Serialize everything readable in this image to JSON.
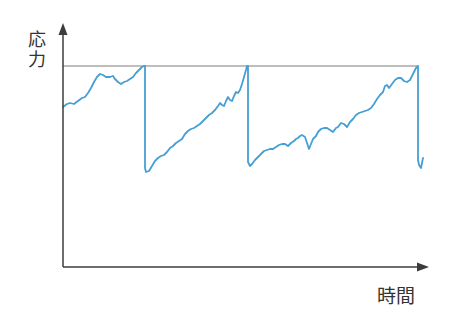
{
  "figure": {
    "ylabel": "応力",
    "xlabel": "時間",
    "colors": {
      "curve": "#459fd4",
      "axis": "#3c3c3c",
      "threshold": "#7f7f7f",
      "text": "#333333",
      "background": "#ffffff"
    }
  },
  "chart_data": {
    "type": "line",
    "title": "",
    "xlabel": "時間",
    "ylabel": "応力",
    "x_ticks": [],
    "y_ticks": [],
    "grid": false,
    "legend": false,
    "axes_px": {
      "y_axis_x": 63,
      "x_axis_y": 267,
      "y_arrow_tip_y": 23,
      "x_arrow_tip_x": 429
    },
    "threshold_line_px": {
      "y": 66,
      "x1": 63,
      "x2": 418
    },
    "series": [
      {
        "name": "応力",
        "color": "#459fd4",
        "points_px": [
          [
            63,
            107
          ],
          [
            67,
            104
          ],
          [
            70,
            103
          ],
          [
            74,
            104
          ],
          [
            78,
            101
          ],
          [
            82,
            98
          ],
          [
            85,
            97
          ],
          [
            88,
            93
          ],
          [
            91,
            88
          ],
          [
            94,
            82
          ],
          [
            97,
            77
          ],
          [
            100,
            74
          ],
          [
            103,
            75
          ],
          [
            106,
            77
          ],
          [
            110,
            77
          ],
          [
            113,
            76
          ],
          [
            115,
            79
          ],
          [
            118,
            82
          ],
          [
            121,
            84
          ],
          [
            124,
            82
          ],
          [
            127,
            81
          ],
          [
            130,
            79
          ],
          [
            133,
            77
          ],
          [
            136,
            73
          ],
          [
            139,
            70
          ],
          [
            142,
            67
          ],
          [
            144,
            66
          ],
          [
            145,
            66
          ],
          [
            145,
            168
          ],
          [
            146,
            172
          ],
          [
            149,
            171
          ],
          [
            152,
            166
          ],
          [
            155,
            161
          ],
          [
            158,
            158
          ],
          [
            161,
            156
          ],
          [
            164,
            155
          ],
          [
            167,
            152
          ],
          [
            170,
            148
          ],
          [
            173,
            146
          ],
          [
            176,
            143
          ],
          [
            179,
            141
          ],
          [
            182,
            139
          ],
          [
            185,
            134
          ],
          [
            188,
            131
          ],
          [
            191,
            129
          ],
          [
            194,
            128
          ],
          [
            197,
            126
          ],
          [
            200,
            124
          ],
          [
            203,
            121
          ],
          [
            206,
            118
          ],
          [
            209,
            115
          ],
          [
            212,
            113
          ],
          [
            215,
            110
          ],
          [
            218,
            106
          ],
          [
            220,
            103
          ],
          [
            222,
            105
          ],
          [
            224,
            106
          ],
          [
            226,
            101
          ],
          [
            228,
            97
          ],
          [
            230,
            100
          ],
          [
            232,
            101
          ],
          [
            234,
            96
          ],
          [
            236,
            92
          ],
          [
            238,
            93
          ],
          [
            240,
            90
          ],
          [
            242,
            84
          ],
          [
            244,
            77
          ],
          [
            246,
            70
          ],
          [
            247,
            66
          ],
          [
            248,
            66
          ],
          [
            248,
            162
          ],
          [
            250,
            166
          ],
          [
            252,
            164
          ],
          [
            255,
            160
          ],
          [
            258,
            157
          ],
          [
            261,
            154
          ],
          [
            264,
            151
          ],
          [
            267,
            150
          ],
          [
            270,
            149
          ],
          [
            273,
            149
          ],
          [
            276,
            147
          ],
          [
            279,
            145
          ],
          [
            282,
            144
          ],
          [
            285,
            144
          ],
          [
            288,
            146
          ],
          [
            291,
            143
          ],
          [
            294,
            141
          ],
          [
            296,
            139
          ],
          [
            298,
            138
          ],
          [
            300,
            136
          ],
          [
            302,
            135
          ],
          [
            305,
            137
          ],
          [
            307,
            143
          ],
          [
            309,
            149
          ],
          [
            311,
            144
          ],
          [
            313,
            139
          ],
          [
            316,
            136
          ],
          [
            318,
            132
          ],
          [
            321,
            129
          ],
          [
            324,
            128
          ],
          [
            327,
            128
          ],
          [
            330,
            130
          ],
          [
            333,
            132
          ],
          [
            336,
            128
          ],
          [
            338,
            127
          ],
          [
            341,
            123
          ],
          [
            344,
            124
          ],
          [
            347,
            127
          ],
          [
            350,
            122
          ],
          [
            353,
            119
          ],
          [
            356,
            115
          ],
          [
            359,
            113
          ],
          [
            362,
            112
          ],
          [
            365,
            111
          ],
          [
            368,
            110
          ],
          [
            371,
            108
          ],
          [
            374,
            104
          ],
          [
            377,
            99
          ],
          [
            380,
            95
          ],
          [
            383,
            92
          ],
          [
            385,
            86
          ],
          [
            387,
            85
          ],
          [
            389,
            88
          ],
          [
            392,
            84
          ],
          [
            395,
            80
          ],
          [
            398,
            78
          ],
          [
            401,
            78
          ],
          [
            404,
            81
          ],
          [
            407,
            82
          ],
          [
            410,
            80
          ],
          [
            413,
            74
          ],
          [
            416,
            68
          ],
          [
            418,
            66
          ],
          [
            418,
            160
          ],
          [
            419,
            165
          ],
          [
            421,
            168
          ],
          [
            423,
            158
          ]
        ]
      }
    ]
  }
}
